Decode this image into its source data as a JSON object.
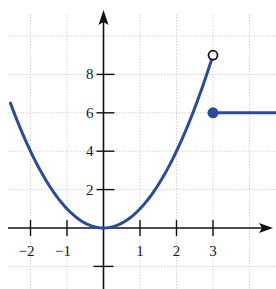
{
  "chart_data": {
    "type": "line",
    "title": "",
    "xlabel": "",
    "ylabel": "",
    "xlim": [
      -2.7,
      4.5
    ],
    "ylim": [
      -3,
      10.8
    ],
    "grid": true,
    "legend": null,
    "x_ticks": [
      -2,
      -1,
      1,
      2,
      3
    ],
    "x_tick_labels": [
      "−2",
      "−1",
      "1",
      "2",
      "3"
    ],
    "y_ticks": [
      2,
      4,
      6,
      8
    ],
    "y_tick_labels": [
      "2",
      "4",
      "6",
      "8"
    ],
    "y_unlabeled_ticks": [
      -2
    ],
    "series": [
      {
        "name": "f(x) = x^2 for x < 3",
        "kind": "curve",
        "function": "x^2",
        "domain": [
          -2.55,
          3
        ],
        "points": [
          [
            -2.5,
            6.25
          ],
          [
            -2,
            4
          ],
          [
            -1,
            1
          ],
          [
            0,
            0
          ],
          [
            1,
            1
          ],
          [
            2,
            4
          ],
          [
            3,
            9
          ]
        ],
        "endpoint": {
          "x": 3,
          "y": 9,
          "style": "open"
        }
      },
      {
        "name": "f(x) = 6 for x >= 3",
        "kind": "horizontal",
        "function": "6",
        "domain": [
          3,
          4.5
        ],
        "points": [
          [
            3,
            6
          ],
          [
            4.5,
            6
          ]
        ],
        "endpoint": {
          "x": 3,
          "y": 6,
          "style": "closed"
        }
      }
    ],
    "colors": {
      "curve": "#2b4a9a",
      "axis": "#111111",
      "grid": "#c8c8c8"
    }
  }
}
